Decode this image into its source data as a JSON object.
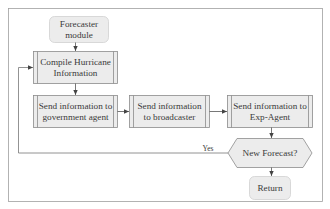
{
  "diagram": {
    "colors": {
      "node_fill": "#ececec",
      "node_stroke": "#8c8c8c",
      "edge": "#555555",
      "frame": "#9a9a9a",
      "text": "#3a3a3a"
    },
    "nodes": [
      {
        "id": "start",
        "shape": "rounded-rect",
        "label": "Forecaster\nmodule"
      },
      {
        "id": "compile",
        "shape": "predefined-process",
        "label": "Compile Hurricane\nInformation"
      },
      {
        "id": "send_gov",
        "shape": "predefined-process",
        "label": "Send information to\ngovernment agent"
      },
      {
        "id": "send_broadcaster",
        "shape": "predefined-process",
        "label": "Send information\nto broadcaster"
      },
      {
        "id": "send_exp",
        "shape": "predefined-process",
        "label": "Send information to\nExp-Agent"
      },
      {
        "id": "decision",
        "shape": "hexagon",
        "label": "New Forecast?"
      },
      {
        "id": "end",
        "shape": "rounded-rect",
        "label": "Return"
      }
    ],
    "edges": [
      {
        "from": "start",
        "to": "compile",
        "label": ""
      },
      {
        "from": "compile",
        "to": "send_gov",
        "label": ""
      },
      {
        "from": "send_gov",
        "to": "send_broadcaster",
        "label": ""
      },
      {
        "from": "send_broadcaster",
        "to": "send_exp",
        "label": ""
      },
      {
        "from": "send_exp",
        "to": "decision",
        "label": ""
      },
      {
        "from": "decision",
        "to": "compile",
        "label": "Yes"
      },
      {
        "from": "decision",
        "to": "end",
        "label": ""
      }
    ],
    "edge_labels": {
      "yes": "Yes"
    }
  }
}
